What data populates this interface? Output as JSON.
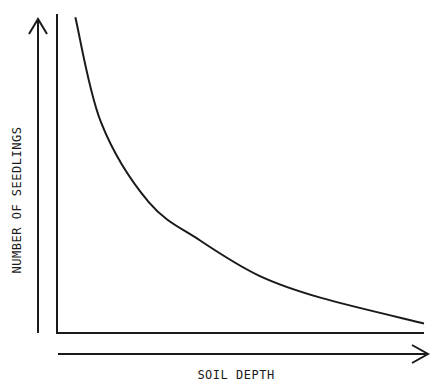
{
  "chart_data": {
    "type": "line",
    "title": "",
    "xlabel": "SOIL DEPTH",
    "ylabel": "NUMBER OF SEEDLINGS",
    "x_ticks": [],
    "y_ticks": [],
    "grid": false,
    "legend": null,
    "series": [
      {
        "name": "seedlings",
        "x": [
          0.05,
          0.12,
          0.25,
          0.39,
          0.55,
          0.72,
          1.0
        ],
        "y": [
          0.99,
          0.66,
          0.41,
          0.29,
          0.18,
          0.11,
          0.03
        ]
      }
    ],
    "xlim": [
      0,
      1
    ],
    "ylim": [
      0,
      1
    ]
  },
  "colors": {
    "ink": "#1a1a1a",
    "background": "#ffffff"
  }
}
